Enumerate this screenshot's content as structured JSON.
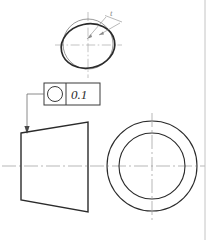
{
  "drawing": {
    "title": "Circularity (roundness) tolerance drawing",
    "background_color": "#ffffff",
    "line_color": "#2b2b2b",
    "thin_line_color": "#555555",
    "centerline_color": "#9a9a9a",
    "detail_view": {
      "name": "roundness-detail-view",
      "nominal_circle": {
        "cx": 88,
        "cy": 44,
        "r": 25,
        "stroke_width": 0.7,
        "note": "thin nominal reference circle"
      },
      "actual_profile": {
        "cx": 88,
        "cy": 46,
        "rx": 27,
        "ry": 22,
        "rotation_deg": -12,
        "stroke_width": 1.6,
        "note": "thick out-of-round actual profile"
      },
      "center_marks": {
        "horizontal": {
          "x1": 55,
          "y1": 45,
          "x2": 122,
          "y2": 45
        },
        "vertical": {
          "x1": 88,
          "y1": 12,
          "x2": 88,
          "y2": 78
        }
      },
      "leader": {
        "label": "t",
        "label_x": 112,
        "label_y": 18,
        "tail": {
          "x1": 122,
          "y1": 22,
          "x2": 104,
          "y2": 16
        },
        "arrow1": {
          "x1": 107,
          "y1": 18,
          "x2": 86,
          "y2": 40
        },
        "arrow2": {
          "x1": 119,
          "y1": 23,
          "x2": 97,
          "y2": 36
        }
      }
    },
    "feature_control_frame": {
      "name": "feature-control-frame",
      "x": 44,
      "y": 83,
      "width": 56,
      "height": 22,
      "divider_x": 66,
      "symbol": "circularity",
      "symbol_glyph": "circle",
      "tolerance_value": "0.1",
      "leader": {
        "segments": [
          {
            "x1": 44,
            "y1": 94,
            "x2": 27,
            "y2": 94
          },
          {
            "x1": 27,
            "y1": 94,
            "x2": 27,
            "y2": 128
          }
        ],
        "arrow_tip": {
          "x": 27,
          "y": 133
        }
      }
    },
    "front_view": {
      "name": "tapered-part-front-view",
      "shape": "trapezoid",
      "points": "21,133 88,122 88,212 21,200",
      "stroke_width": 1.3
    },
    "end_view": {
      "name": "end-view-concentric-circles",
      "cx": 152,
      "cy": 166,
      "outer_radius": 45,
      "inner_radius": 33,
      "stroke_width": 1.0
    },
    "centerlines": {
      "horizontal_main": {
        "x1": 2,
        "y1": 166,
        "x2": 205,
        "y2": 166
      },
      "vertical_end_view": {
        "x1": 152,
        "y1": 113,
        "x2": 152,
        "y2": 220
      }
    },
    "border": {
      "name": "sheet-border-right",
      "x": 205,
      "y1": 0,
      "y2": 240
    }
  }
}
